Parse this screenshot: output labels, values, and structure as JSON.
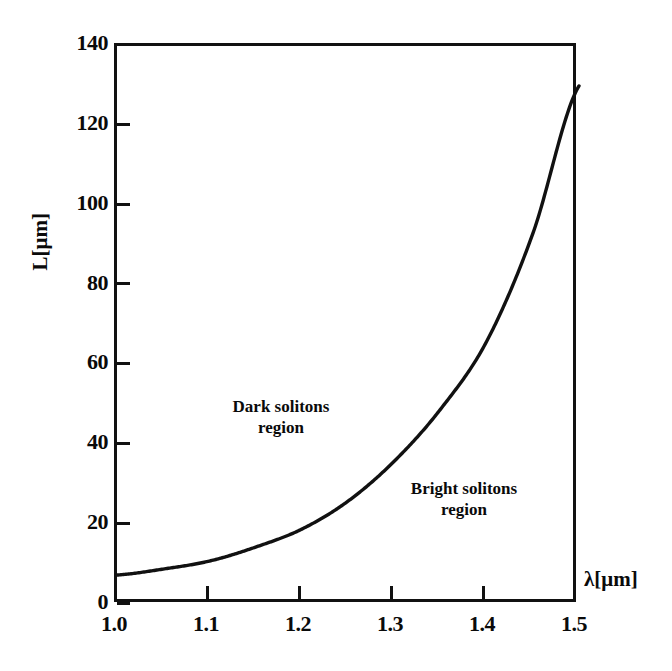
{
  "chart_data": {
    "type": "line",
    "title": "",
    "subtitle": "",
    "xlabel": "λ[μm]",
    "ylabel": "L[μm]",
    "xlim": [
      1.0,
      1.5
    ],
    "ylim": [
      0,
      140
    ],
    "grid": false,
    "legend": false,
    "x_ticks": [
      "1.0",
      "1.1",
      "1.2",
      "1.3",
      "1.4",
      "1.5"
    ],
    "x_tick_values": [
      1.0,
      1.1,
      1.2,
      1.3,
      1.4,
      1.5
    ],
    "y_ticks": [
      "0",
      "20",
      "40",
      "60",
      "80",
      "100",
      "120",
      "140"
    ],
    "y_tick_values": [
      0,
      20,
      40,
      60,
      80,
      100,
      120,
      140
    ],
    "series": [
      {
        "name": "boundary curve",
        "color": "#111111",
        "x": [
          1.0,
          1.05,
          1.1,
          1.15,
          1.2,
          1.25,
          1.3,
          1.35,
          1.4,
          1.45,
          1.5
        ],
        "values": [
          7.5,
          9.0,
          11.0,
          14.5,
          19.0,
          26.0,
          36.0,
          49.0,
          66.0,
          93.0,
          130.0
        ]
      }
    ],
    "annotations": [
      {
        "text": "Dark solitons region",
        "line1": "Dark solitons",
        "line2": "region",
        "x": 1.16,
        "y": 48
      },
      {
        "text": "Bright solitons region",
        "line1": "Bright solitons",
        "line2": "region",
        "x": 1.36,
        "y": 27
      }
    ]
  },
  "axes": {
    "y_title": "L[μm]",
    "x_title": "λ[μm]",
    "y_labels": [
      "140",
      "120",
      "100",
      "80",
      "60",
      "40",
      "20",
      "0"
    ],
    "x_labels": [
      "1.0",
      "1.1",
      "1.2",
      "1.3",
      "1.4",
      "1.5"
    ]
  },
  "annotations": {
    "dark_line1": "Dark solitons",
    "dark_line2": "region",
    "bright_line1": "Bright solitons",
    "bright_line2": "region"
  },
  "colors": {
    "ink": "#111111",
    "background": "#ffffff"
  }
}
